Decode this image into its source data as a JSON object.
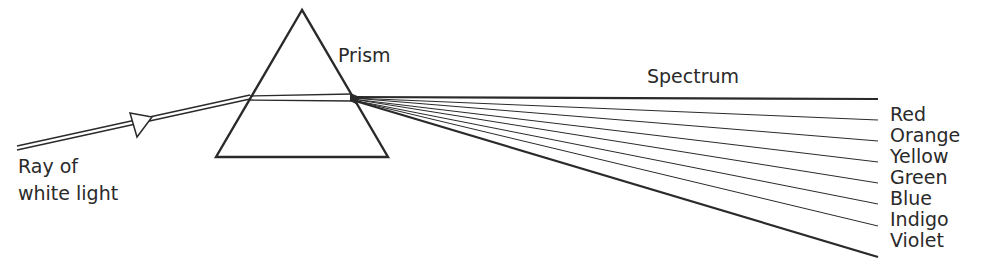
{
  "diagram": {
    "labels": {
      "prism": "Prism",
      "spectrum": "Spectrum",
      "ray_line1": "Ray of",
      "ray_line2": "white light"
    },
    "spectrum_colors": [
      "Red",
      "Orange",
      "Yellow",
      "Green",
      "Blue",
      "Indigo",
      "Violet"
    ],
    "stroke_color": "#2a2a2a",
    "background": "#ffffff"
  }
}
